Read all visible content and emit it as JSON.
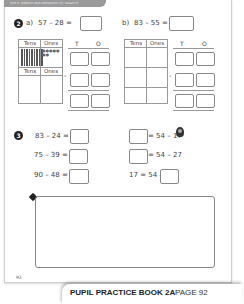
{
  "header": {
    "strip_text": "Unit 4: Addition and subtraction (2), Lesson 6"
  },
  "q2": {
    "number": "2",
    "a": {
      "label": "a)",
      "expression": "57 – 28 ="
    },
    "b": {
      "label": "b)",
      "expression": "83 – 55 ="
    },
    "place_value": {
      "tens": "Tens",
      "ones": "Ones"
    },
    "columns": {
      "t": "T",
      "o": "O"
    },
    "minus": "-"
  },
  "q3": {
    "number": "3",
    "left": [
      "83 – 24 =",
      "75 – 39 =",
      "90 – 48 ="
    ],
    "right": [
      "= 54 – 17",
      "= 54 – 27",
      "17 = 54 –"
    ]
  },
  "page_number": "92",
  "footer": {
    "book": "PUPIL PRACTICE BOOK 2A",
    "page": "PAGE 92"
  }
}
